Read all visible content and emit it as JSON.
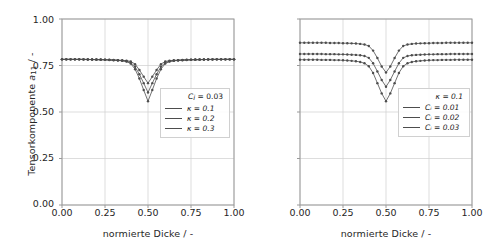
{
  "figure": {
    "background": "#ffffff",
    "line_color": "#4d4d4d",
    "grid_color": "#cfcfcf",
    "axis_color": "#9a9a9a"
  },
  "chart_data": [
    {
      "id": "left",
      "type": "line",
      "title": "",
      "xlabel": "normierte Dicke / -",
      "ylabel": "Tensorkomponente a11 / -",
      "xlim": [
        0.0,
        1.0
      ],
      "ylim": [
        0.0,
        1.0
      ],
      "xticks": [
        "0.00",
        "0.25",
        "0.50",
        "0.75",
        "1.00"
      ],
      "xtick_values": [
        0.0,
        0.25,
        0.5,
        0.75,
        1.0
      ],
      "yticks": [
        "0.00",
        "0.25",
        "0.50",
        "0.75",
        "1.00"
      ],
      "ytick_values": [
        0.0,
        0.25,
        0.5,
        0.75,
        1.0
      ],
      "grid": true,
      "legend_position": "lower right",
      "legend_title": "Ci = 0.03",
      "markers": "circle",
      "series": [
        {
          "name": "x = 0.1",
          "x": [
            0.0,
            0.025,
            0.05,
            0.075,
            0.1,
            0.125,
            0.15,
            0.175,
            0.2,
            0.225,
            0.25,
            0.275,
            0.3,
            0.325,
            0.35,
            0.375,
            0.4,
            0.425,
            0.45,
            0.475,
            0.5,
            0.525,
            0.55,
            0.575,
            0.6,
            0.625,
            0.65,
            0.675,
            0.7,
            0.725,
            0.75,
            0.775,
            0.8,
            0.825,
            0.85,
            0.875,
            0.9,
            0.925,
            0.95,
            0.975,
            1.0
          ],
          "values": [
            0.783,
            0.783,
            0.783,
            0.783,
            0.783,
            0.783,
            0.783,
            0.782,
            0.782,
            0.782,
            0.781,
            0.781,
            0.78,
            0.779,
            0.778,
            0.776,
            0.772,
            0.757,
            0.726,
            0.69,
            0.655,
            0.69,
            0.726,
            0.757,
            0.772,
            0.776,
            0.778,
            0.779,
            0.78,
            0.781,
            0.781,
            0.782,
            0.782,
            0.782,
            0.783,
            0.783,
            0.783,
            0.783,
            0.783,
            0.783,
            0.783
          ]
        },
        {
          "name": "x = 0.2",
          "x": [
            0.0,
            0.025,
            0.05,
            0.075,
            0.1,
            0.125,
            0.15,
            0.175,
            0.2,
            0.225,
            0.25,
            0.275,
            0.3,
            0.325,
            0.35,
            0.375,
            0.4,
            0.425,
            0.45,
            0.475,
            0.5,
            0.525,
            0.55,
            0.575,
            0.6,
            0.625,
            0.65,
            0.675,
            0.7,
            0.725,
            0.75,
            0.775,
            0.8,
            0.825,
            0.85,
            0.875,
            0.9,
            0.925,
            0.95,
            0.975,
            1.0
          ],
          "values": [
            0.783,
            0.783,
            0.783,
            0.783,
            0.783,
            0.783,
            0.782,
            0.782,
            0.782,
            0.781,
            0.781,
            0.78,
            0.779,
            0.778,
            0.776,
            0.773,
            0.766,
            0.743,
            0.703,
            0.655,
            0.605,
            0.655,
            0.703,
            0.743,
            0.766,
            0.773,
            0.776,
            0.778,
            0.779,
            0.78,
            0.781,
            0.781,
            0.782,
            0.782,
            0.782,
            0.783,
            0.783,
            0.783,
            0.783,
            0.783,
            0.783
          ]
        },
        {
          "name": "x = 0.3",
          "x": [
            0.0,
            0.025,
            0.05,
            0.075,
            0.1,
            0.125,
            0.15,
            0.175,
            0.2,
            0.225,
            0.25,
            0.275,
            0.3,
            0.325,
            0.35,
            0.375,
            0.4,
            0.425,
            0.45,
            0.475,
            0.5,
            0.525,
            0.55,
            0.575,
            0.6,
            0.625,
            0.65,
            0.675,
            0.7,
            0.725,
            0.75,
            0.775,
            0.8,
            0.825,
            0.85,
            0.875,
            0.9,
            0.925,
            0.95,
            0.975,
            1.0
          ],
          "values": [
            0.783,
            0.783,
            0.783,
            0.783,
            0.783,
            0.782,
            0.782,
            0.782,
            0.781,
            0.781,
            0.78,
            0.779,
            0.778,
            0.777,
            0.775,
            0.771,
            0.76,
            0.73,
            0.68,
            0.618,
            0.558,
            0.618,
            0.68,
            0.73,
            0.76,
            0.771,
            0.775,
            0.777,
            0.778,
            0.779,
            0.78,
            0.781,
            0.781,
            0.782,
            0.782,
            0.782,
            0.783,
            0.783,
            0.783,
            0.783,
            0.783
          ]
        }
      ]
    },
    {
      "id": "right",
      "type": "line",
      "title": "",
      "xlabel": "normierte Dicke / -",
      "ylabel": "",
      "xlim": [
        0.0,
        1.0
      ],
      "ylim": [
        0.0,
        1.0
      ],
      "xticks": [
        "0.00",
        "0.25",
        "0.50",
        "0.75",
        "1.00"
      ],
      "xtick_values": [
        0.0,
        0.25,
        0.5,
        0.75,
        1.0
      ],
      "yticks": [
        "",
        "",
        "",
        "",
        ""
      ],
      "ytick_values": [
        0.0,
        0.25,
        0.5,
        0.75,
        1.0
      ],
      "grid": true,
      "legend_position": "lower right",
      "legend_title": "x = 0.1",
      "markers": "circle",
      "series": [
        {
          "name": "Ci = 0.01",
          "x": [
            0.0,
            0.025,
            0.05,
            0.075,
            0.1,
            0.125,
            0.15,
            0.175,
            0.2,
            0.225,
            0.25,
            0.275,
            0.3,
            0.325,
            0.35,
            0.375,
            0.4,
            0.425,
            0.45,
            0.475,
            0.5,
            0.525,
            0.55,
            0.575,
            0.6,
            0.625,
            0.65,
            0.675,
            0.7,
            0.725,
            0.75,
            0.775,
            0.8,
            0.825,
            0.85,
            0.875,
            0.9,
            0.925,
            0.95,
            0.975,
            1.0
          ],
          "values": [
            0.872,
            0.872,
            0.872,
            0.872,
            0.872,
            0.872,
            0.872,
            0.871,
            0.871,
            0.871,
            0.87,
            0.87,
            0.869,
            0.868,
            0.866,
            0.863,
            0.855,
            0.83,
            0.79,
            0.745,
            0.712,
            0.745,
            0.79,
            0.83,
            0.855,
            0.863,
            0.866,
            0.868,
            0.869,
            0.87,
            0.87,
            0.871,
            0.871,
            0.871,
            0.872,
            0.872,
            0.872,
            0.872,
            0.872,
            0.872,
            0.872
          ]
        },
        {
          "name": "Ci = 0.02",
          "x": [
            0.0,
            0.025,
            0.05,
            0.075,
            0.1,
            0.125,
            0.15,
            0.175,
            0.2,
            0.225,
            0.25,
            0.275,
            0.3,
            0.325,
            0.35,
            0.375,
            0.4,
            0.425,
            0.45,
            0.475,
            0.5,
            0.525,
            0.55,
            0.575,
            0.6,
            0.625,
            0.65,
            0.675,
            0.7,
            0.725,
            0.75,
            0.775,
            0.8,
            0.825,
            0.85,
            0.875,
            0.9,
            0.925,
            0.95,
            0.975,
            1.0
          ],
          "values": [
            0.812,
            0.812,
            0.812,
            0.812,
            0.812,
            0.812,
            0.811,
            0.811,
            0.811,
            0.81,
            0.81,
            0.809,
            0.808,
            0.807,
            0.805,
            0.801,
            0.791,
            0.762,
            0.718,
            0.672,
            0.636,
            0.672,
            0.718,
            0.762,
            0.791,
            0.801,
            0.805,
            0.807,
            0.808,
            0.809,
            0.81,
            0.81,
            0.811,
            0.811,
            0.811,
            0.812,
            0.812,
            0.812,
            0.812,
            0.812,
            0.812
          ]
        },
        {
          "name": "Ci = 0.03",
          "x": [
            0.0,
            0.025,
            0.05,
            0.075,
            0.1,
            0.125,
            0.15,
            0.175,
            0.2,
            0.225,
            0.25,
            0.275,
            0.3,
            0.325,
            0.35,
            0.375,
            0.4,
            0.425,
            0.45,
            0.475,
            0.5,
            0.525,
            0.55,
            0.575,
            0.6,
            0.625,
            0.65,
            0.675,
            0.7,
            0.725,
            0.75,
            0.775,
            0.8,
            0.825,
            0.85,
            0.875,
            0.9,
            0.925,
            0.95,
            0.975,
            1.0
          ],
          "values": [
            0.781,
            0.781,
            0.781,
            0.781,
            0.781,
            0.78,
            0.78,
            0.78,
            0.779,
            0.779,
            0.778,
            0.777,
            0.775,
            0.773,
            0.769,
            0.762,
            0.746,
            0.71,
            0.655,
            0.6,
            0.558,
            0.6,
            0.655,
            0.71,
            0.746,
            0.762,
            0.769,
            0.773,
            0.775,
            0.777,
            0.778,
            0.779,
            0.779,
            0.78,
            0.78,
            0.78,
            0.781,
            0.781,
            0.781,
            0.781,
            0.781
          ]
        }
      ]
    }
  ],
  "left_panel": {
    "xlabel": "normierte Dicke / -",
    "ylabel_prefix": "Tensorkomponente ",
    "ylabel_symbol": "a",
    "ylabel_sub": "11",
    "ylabel_suffix": " / -",
    "legend": {
      "title_symbol": "C",
      "title_sub": "i",
      "title_rest": " = 0.03",
      "rows": [
        "κ = 0.1",
        "κ = 0.2",
        "κ = 0.3"
      ]
    }
  },
  "right_panel": {
    "xlabel": "normierte Dicke / -",
    "legend": {
      "title": "κ = 0.1",
      "rows": [
        "Cᵢ = 0.01",
        "Cᵢ = 0.02",
        "Cᵢ = 0.03"
      ]
    }
  }
}
